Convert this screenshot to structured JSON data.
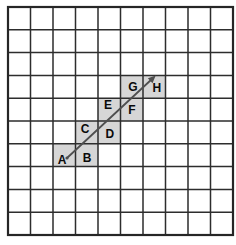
{
  "figure": {
    "grid": {
      "columns": 10,
      "rows": 10
    },
    "shaded_cells": [
      {
        "label": "A",
        "col": 2,
        "row": 6,
        "lx": 0.4,
        "ly": 0.71
      },
      {
        "label": "B",
        "col": 3,
        "row": 6,
        "lx": 0.51,
        "ly": 0.6
      },
      {
        "label": "C",
        "col": 3,
        "row": 5,
        "lx": 0.42,
        "ly": 0.33
      },
      {
        "label": "D",
        "col": 4,
        "row": 5,
        "lx": 0.53,
        "ly": 0.55
      },
      {
        "label": "E",
        "col": 4,
        "row": 4,
        "lx": 0.44,
        "ly": 0.31
      },
      {
        "label": "F",
        "col": 5,
        "row": 4,
        "lx": 0.51,
        "ly": 0.53
      },
      {
        "label": "G",
        "col": 5,
        "row": 3,
        "lx": 0.55,
        "ly": 0.52
      },
      {
        "label": "H",
        "col": 6,
        "row": 3,
        "lx": 0.62,
        "ly": 0.56
      }
    ],
    "arrow": {
      "from_label": "A",
      "to_label": "H",
      "x1": 67,
      "y1": 158,
      "x2": 152,
      "y2": 79
    },
    "colors": {
      "background": "#ffffff",
      "cell_fill": "#d6d6d6",
      "grid_line": "#2d2d2d",
      "border_line": "#262626",
      "arrow": "#4f4f4f",
      "label": "#0a0a0a"
    }
  }
}
